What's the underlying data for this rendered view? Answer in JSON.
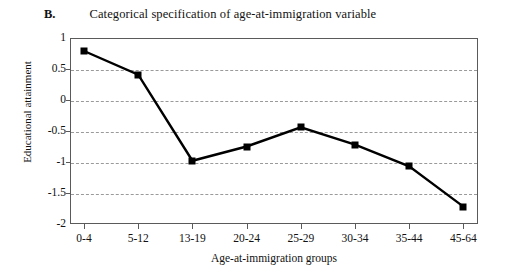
{
  "figure": {
    "panel_letter": "B.",
    "title": "Categorical specification of age-at-immigration variable"
  },
  "chart_data": {
    "type": "line",
    "title": "Categorical specification of age-at-immigration variable",
    "subtitle": "",
    "xlabel": "Age-at-immigration groups",
    "ylabel": "Educational attainment",
    "categories": [
      "0-4",
      "5-12",
      "13-19",
      "20-24",
      "25-29",
      "30-34",
      "35-44",
      "45-64"
    ],
    "values": [
      0.79,
      0.41,
      -0.98,
      -0.75,
      -0.44,
      -0.72,
      -1.07,
      -1.72
    ],
    "series": [
      {
        "name": "Educational attainment",
        "values": [
          0.79,
          0.41,
          -0.98,
          -0.75,
          -0.44,
          -0.72,
          -1.07,
          -1.72
        ],
        "color": "#000000",
        "marker": "filled-square"
      }
    ],
    "ylim": [
      -2,
      1
    ],
    "yticks": [
      1,
      0.5,
      0,
      -0.5,
      -1,
      -1.5,
      -2
    ],
    "ytick_labels": [
      "1",
      "0.5",
      "0",
      "-0.5",
      "-1",
      "-1.5",
      "-2"
    ],
    "grid": "horizontal-dashed",
    "legend": "none",
    "legend_position": "none",
    "frame": "box"
  },
  "colors": {
    "line": "#000000",
    "marker": "#000000",
    "grid": "#9a9a9a",
    "axis": "#5a5a5a",
    "background": "#ffffff"
  }
}
